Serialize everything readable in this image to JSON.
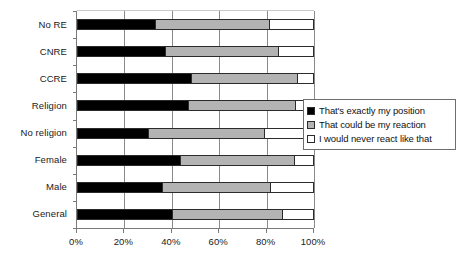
{
  "chart_data": {
    "type": "bar",
    "orientation": "horizontal",
    "stacked": true,
    "normalized": "100%",
    "title": "",
    "xlabel": "",
    "ylabel": "",
    "xlim": [
      0,
      100
    ],
    "xticks": [
      "0%",
      "20%",
      "40%",
      "60%",
      "80%",
      "100%"
    ],
    "xtick_values": [
      0,
      20,
      40,
      60,
      80,
      100
    ],
    "grid": "vertical",
    "legend_position": "right-middle-overlay",
    "categories": [
      "No RE",
      "CNRE",
      "CCRE",
      "Religion",
      "No religion",
      "Female",
      "Male",
      "General"
    ],
    "series": [
      {
        "name": "That's exactly my position",
        "color": "#000000",
        "values": [
          33,
          37,
          48,
          47,
          30,
          43.5,
          36,
          40
        ]
      },
      {
        "name": "That could be my reaction",
        "color": "#b3b3b3",
        "values": [
          48,
          48,
          45,
          45,
          49,
          48,
          45.5,
          46.5
        ]
      },
      {
        "name": "I would never react like that",
        "color": "#ffffff",
        "values": [
          19,
          15,
          7,
          8,
          21,
          8.5,
          18.5,
          13.5
        ]
      }
    ]
  },
  "legend": {
    "items": [
      {
        "label": "That's exactly my position",
        "swatch": "black-swatch-icon"
      },
      {
        "label": "That could be my reaction",
        "swatch": "gray-swatch-icon"
      },
      {
        "label": "I would never react like that",
        "swatch": "white-swatch-icon"
      }
    ]
  },
  "colors": {
    "series_a": "#000000",
    "series_b": "#b3b3b3",
    "series_c": "#ffffff",
    "axis": "#7a7a7a",
    "gridline": "#8a8a8a",
    "bar_outline": "#2b2b2b",
    "text": "#1a1a1a",
    "background": "#ffffff"
  }
}
